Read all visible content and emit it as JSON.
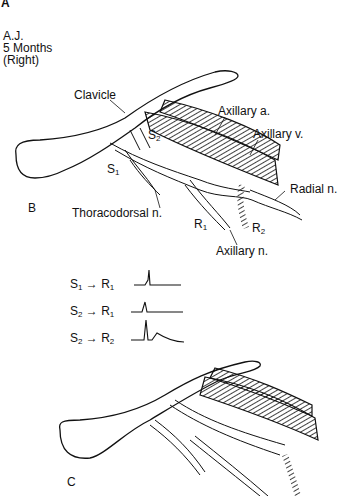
{
  "panels": {
    "A": {
      "letter": "A",
      "patient": "A.J.",
      "age": "5 Months",
      "side": "(Right)"
    },
    "B": {
      "letter": "B"
    },
    "C": {
      "letter": "C"
    }
  },
  "labels": {
    "clavicle": "Clavicle",
    "axillary_a": "Axillary a.",
    "axillary_v": "Axillary v.",
    "radial_n": "Radial n.",
    "thoracodorsal_n": "Thoracodorsal n.",
    "axillary_n": "Axillary n.",
    "s1": "S",
    "s1_sub": "1",
    "s2": "S",
    "s2_sub": "2",
    "r1": "R",
    "r1_sub": "1",
    "r2": "R",
    "r2_sub": "2"
  },
  "traces": [
    {
      "from": "S",
      "from_sub": "1",
      "to": "R",
      "to_sub": "1"
    },
    {
      "from": "S",
      "from_sub": "2",
      "to": "R",
      "to_sub": "1"
    },
    {
      "from": "S",
      "from_sub": "2",
      "to": "R",
      "to_sub": "2"
    }
  ]
}
